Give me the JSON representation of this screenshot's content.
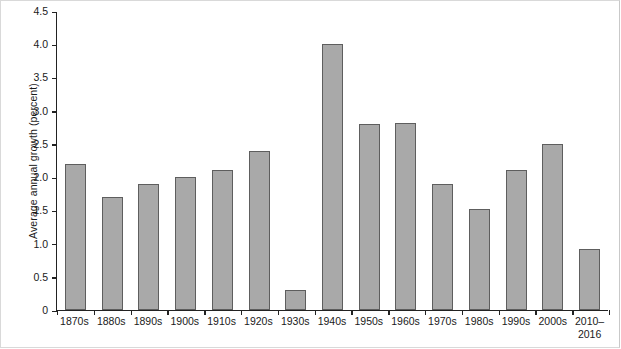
{
  "chart_data": {
    "type": "bar",
    "title": "",
    "xlabel": "",
    "ylabel": "Average annual growth (percent)",
    "categories": [
      "1870s",
      "1880s",
      "1890s",
      "1900s",
      "1910s",
      "1920s",
      "1930s",
      "1940s",
      "1950s",
      "1960s",
      "1970s",
      "1980s",
      "1990s",
      "2000s",
      "2010–\n2016"
    ],
    "values": [
      2.2,
      1.7,
      1.9,
      2.0,
      2.1,
      2.4,
      0.3,
      4.0,
      2.8,
      2.82,
      1.9,
      1.52,
      2.1,
      2.5,
      0.92
    ],
    "ylim": [
      0,
      4.5
    ],
    "yticks": [
      "0",
      "0.5",
      "1.0",
      "1.5",
      "2.0",
      "2.5",
      "3.0",
      "3.5",
      "4.0",
      "4.5"
    ],
    "ytick_values": [
      0,
      0.5,
      1.0,
      1.5,
      2.0,
      2.5,
      3.0,
      3.5,
      4.0,
      4.5
    ],
    "grid": false,
    "legend": null,
    "bar_color": "#a9a9a9",
    "bar_edge_color": "#5e5e5e",
    "axis_color": "#222222",
    "background": "#ffffff"
  }
}
